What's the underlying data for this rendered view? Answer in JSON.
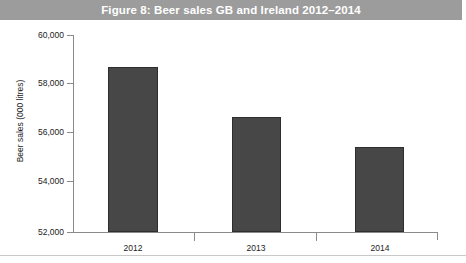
{
  "figure": {
    "title": "Figure 8: Beer sales GB and Ireland 2012–2014",
    "banner_color": "#9c9c9c",
    "title_color": "#ffffff",
    "bar_color": "#474747",
    "axis_color": "#8a8a8a"
  },
  "chart_data": {
    "type": "bar",
    "title": "Figure 8: Beer sales GB and Ireland 2012–2014",
    "categories": [
      "2012",
      "2013",
      "2014"
    ],
    "values": [
      58700,
      56650,
      55450
    ],
    "series": [
      {
        "name": "Beer sales",
        "values": [
          58700,
          56650,
          55450
        ]
      }
    ],
    "xlabel": "",
    "ylabel": "Beer sales (000 litres)",
    "ylim": [
      52000,
      60000
    ],
    "ytick_step": 2000,
    "ytick_labels": [
      "60,000",
      "58,000",
      "56,000",
      "54,000",
      "52,000"
    ],
    "ytick_values": [
      60000,
      58000,
      56000,
      54000,
      52000
    ],
    "grid": false,
    "legend": false
  }
}
